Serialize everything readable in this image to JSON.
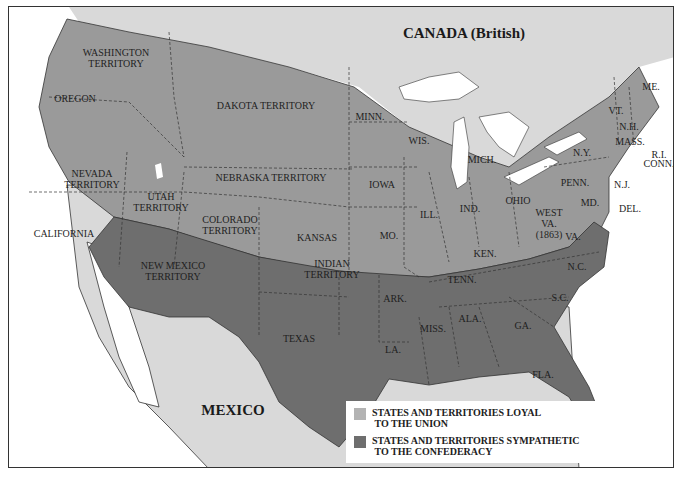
{
  "map": {
    "title_regions": {
      "canada": "CANADA (British)",
      "mexico": "MEXICO"
    },
    "colors": {
      "union": "#9a9a9a",
      "confederacy": "#6e6e6e",
      "foreign": "#d9d9d9",
      "water": "#ffffff",
      "border": "#333333"
    },
    "labels": {
      "washington": [
        "WASHINGTON",
        "TERRITORY"
      ],
      "oregon": "OREGON",
      "dakota": "DAKOTA TERRITORY",
      "nevada": [
        "NEVADA",
        "TERRITORY"
      ],
      "utah": [
        "UTAH",
        "TERRITORY"
      ],
      "nebraska": "NEBRASKA TERRITORY",
      "colorado": [
        "COLORADO",
        "TERRITORY"
      ],
      "california": "CALIFORNIA",
      "kansas": "KANSAS",
      "minn": "MINN.",
      "wis": "WIS.",
      "iowa": "IOWA",
      "mich": "MICH.",
      "ill": "ILL.",
      "ind": "IND.",
      "ohio": "OHIO",
      "mo": "MO.",
      "ken": "KEN.",
      "ny": "N.Y.",
      "penn": "PENN.",
      "nj": "N.J.",
      "del": "DEL.",
      "md": "MD.",
      "me": "ME.",
      "vt": "VT.",
      "nh": "N.H.",
      "mass": "MASS.",
      "ri": "R.I.",
      "conn": "CONN.",
      "west_va": [
        "WEST",
        "VA.",
        "(1863)"
      ],
      "va": "VA.",
      "nc": "N.C.",
      "sc": "S.C.",
      "tenn": "TENN.",
      "ga": "GA.",
      "ala": "ALA.",
      "miss": "MISS.",
      "fla": "FLA.",
      "la": "LA.",
      "ark": "ARK.",
      "texas": "TEXAS",
      "new_mexico": [
        "NEW MEXICO",
        "TERRITORY"
      ],
      "indian": [
        "INDIAN",
        "TERRITORY"
      ]
    }
  },
  "legend": {
    "items": [
      {
        "label_line1": "STATES AND TERRITORIES LOYAL",
        "label_line2": "TO THE UNION",
        "color": "#9a9a9a"
      },
      {
        "label_line1": "STATES AND TERRITORIES SYMPATHETIC",
        "label_line2": "TO THE CONFEDERACY",
        "color": "#6e6e6e"
      }
    ]
  }
}
